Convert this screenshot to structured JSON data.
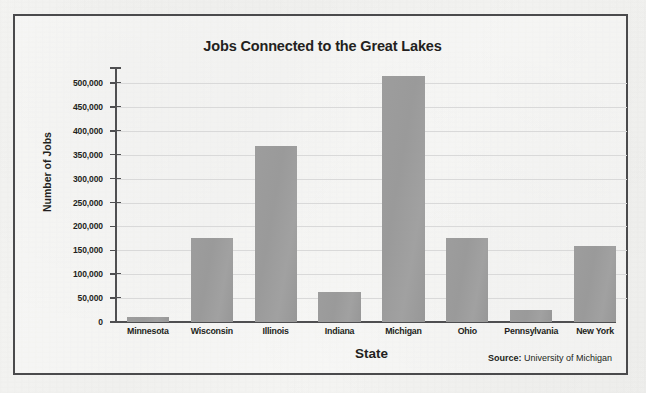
{
  "figure": {
    "title": "Jobs Connected to the Great Lakes",
    "source_label": "Source:",
    "source_text": " University of Michigan",
    "border_color": "#4a4a4c",
    "bar_color": "#9a9a9a",
    "gridline_color": "#d9d9d9",
    "text_color": "#231f20",
    "background_color": "#f2f2f0"
  },
  "chart_data": {
    "type": "bar",
    "title": "Jobs Connected to the Great Lakes",
    "xlabel": "State",
    "ylabel": "Number of Jobs",
    "categories": [
      "Minnesota",
      "Wisconsin",
      "Illinois",
      "Indiana",
      "Michigan",
      "Ohio",
      "Pennsylvania",
      "New York"
    ],
    "values": [
      11000,
      176000,
      368000,
      63000,
      515000,
      176000,
      25000,
      160000
    ],
    "ylim": [
      0,
      530000
    ],
    "ytick_values": [
      0,
      50000,
      100000,
      150000,
      200000,
      250000,
      300000,
      350000,
      400000,
      450000,
      500000
    ],
    "ytick_labels": [
      "0",
      "50,000",
      "100,000",
      "150,000",
      "200,000",
      "250,000",
      "300,000",
      "350,000",
      "400,000",
      "450,000",
      "500,000"
    ],
    "grid": true,
    "grid_axis": "y",
    "legend": false,
    "annotation": "Source: University of Michigan"
  }
}
